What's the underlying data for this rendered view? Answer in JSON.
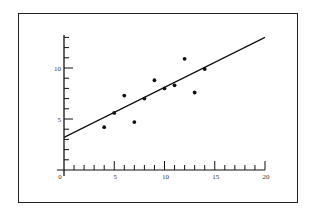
{
  "chart_data": {
    "type": "scatter",
    "title": "",
    "xlabel": "",
    "ylabel": "",
    "xlim": [
      0,
      20
    ],
    "ylim": [
      0,
      13
    ],
    "grid": false,
    "legend": null,
    "x_ticks": {
      "major": [
        0,
        5,
        10,
        15,
        20
      ],
      "minor_step": 1
    },
    "y_ticks": {
      "major": [
        5,
        10
      ],
      "minor_step": 1
    },
    "x_tick_labels": [
      "0",
      "5",
      "10",
      "15",
      "20"
    ],
    "y_tick_labels": [
      "5",
      "10"
    ],
    "points": [
      {
        "x": 4,
        "y": 4.2
      },
      {
        "x": 5,
        "y": 5.6
      },
      {
        "x": 6,
        "y": 7.3
      },
      {
        "x": 7,
        "y": 4.7
      },
      {
        "x": 8,
        "y": 7.0
      },
      {
        "x": 9,
        "y": 8.8
      },
      {
        "x": 10,
        "y": 8.0
      },
      {
        "x": 11,
        "y": 8.3
      },
      {
        "x": 12,
        "y": 10.9
      },
      {
        "x": 13,
        "y": 7.6
      },
      {
        "x": 14,
        "y": 9.9
      }
    ],
    "fit_line": {
      "x0": 0,
      "y0": 3.2,
      "x1": 20,
      "y1": 13.0
    },
    "colors": {
      "points": "#111111",
      "line": "#111111",
      "axes": "#111111",
      "frame": "#222222"
    }
  }
}
